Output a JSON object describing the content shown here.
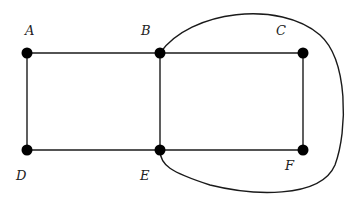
{
  "graph": {
    "nodes": [
      {
        "id": "A",
        "label": "A",
        "x": 27,
        "y": 53,
        "lx": 25,
        "ly": 35
      },
      {
        "id": "B",
        "label": "B",
        "x": 160,
        "y": 53,
        "lx": 141,
        "ly": 35
      },
      {
        "id": "C",
        "label": "C",
        "x": 303,
        "y": 53,
        "lx": 276,
        "ly": 35
      },
      {
        "id": "D",
        "label": "D",
        "x": 27,
        "y": 150,
        "lx": 16,
        "ly": 180
      },
      {
        "id": "E",
        "label": "E",
        "x": 160,
        "y": 150,
        "lx": 140,
        "ly": 180
      },
      {
        "id": "F",
        "label": "F",
        "x": 303,
        "y": 150,
        "lx": 285,
        "ly": 170
      }
    ],
    "edges": [
      {
        "from": "A",
        "to": "B",
        "type": "straight"
      },
      {
        "from": "B",
        "to": "C",
        "type": "straight"
      },
      {
        "from": "A",
        "to": "D",
        "type": "straight"
      },
      {
        "from": "B",
        "to": "E",
        "type": "straight"
      },
      {
        "from": "C",
        "to": "F",
        "type": "straight"
      },
      {
        "from": "D",
        "to": "E",
        "type": "straight"
      },
      {
        "from": "E",
        "to": "F",
        "type": "straight"
      },
      {
        "from": "B",
        "to": "E",
        "type": "curved",
        "path": "M160,53 C190,10 280,0 320,35 C348,60 348,130 335,165 C320,200 250,195 210,185 C170,172 160,165 160,150"
      }
    ],
    "colors": {
      "edge": "#1a1a1a",
      "node": "#000000",
      "label": "#222222",
      "background": "#ffffff"
    }
  }
}
